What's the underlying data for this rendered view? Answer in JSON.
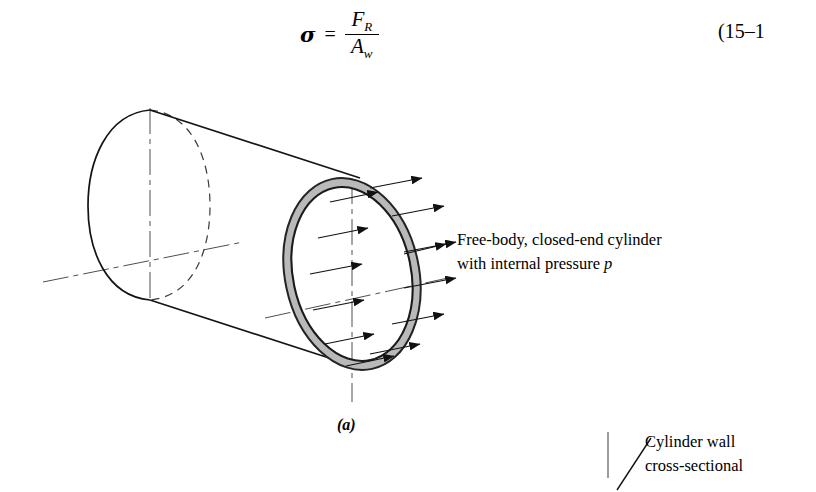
{
  "equation": {
    "symbol": "σ",
    "relation": "=",
    "numerator": "F",
    "numerator_sub": "R",
    "denominator": "A",
    "denominator_sub": "w",
    "number": "(15–1"
  },
  "callouts": {
    "free_body_line1": "Free-body, closed-end cylinder",
    "free_body_line2_pre": "with internal pressure ",
    "free_body_line2_italic": "p",
    "cylinder_wall_line1": "Cylinder wall",
    "cylinder_wall_line2": "cross-sectional"
  },
  "figure": {
    "label": "(a)"
  },
  "colors": {
    "ink": "#1a1a1a",
    "ring_fill": "#b9b9b9",
    "ring_stroke": "#2a2a2a",
    "centerline": "#4a4a4a",
    "page": "#ffffff"
  },
  "arrows": {
    "count": 12,
    "meaning": "internal pressure p acting radially outward on cylinder wall"
  }
}
